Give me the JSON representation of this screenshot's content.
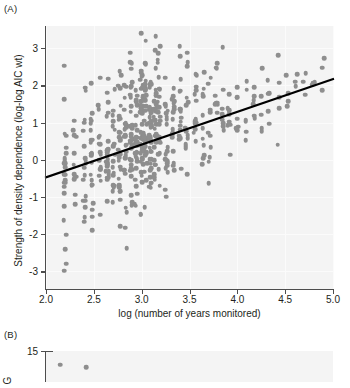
{
  "figure": {
    "panel_a_tag": "(A)",
    "panel_b_tag": "(B)",
    "point_color": "#8e8e8e",
    "line_color": "#000000",
    "plot_background": "#f4f4f4",
    "axis_color": "#4d4d4d"
  },
  "chart_data": {
    "type": "scatter",
    "title": "",
    "xlabel": "log (number of years monitored)",
    "ylabel": "Strength of density dependence (log-log AIC wt)",
    "xlim": [
      2.0,
      5.0
    ],
    "ylim": [
      -3.5,
      3.6
    ],
    "xticks": [
      2.0,
      2.5,
      3.0,
      3.5,
      4.0,
      4.5,
      5.0
    ],
    "xticklabels": [
      "2.0",
      "2.5",
      "3.0",
      "3.5",
      "4.0",
      "4.5",
      "5.0"
    ],
    "yticks": [
      -3,
      -2,
      -1,
      0,
      1,
      2,
      3
    ],
    "yticklabels": [
      "-3",
      "-2",
      "-1",
      "0",
      "1",
      "2",
      "3"
    ],
    "grid": true,
    "legend": "none",
    "fit_line": {
      "type": "linear",
      "x_start": 2.0,
      "y_start": -0.47,
      "x_end": 5.0,
      "y_end": 2.17,
      "slope": 0.88,
      "intercept": -2.23
    },
    "point_columns": [
      {
        "x": 2.2,
        "n": 26,
        "y_center": -0.35,
        "y_spread": 2.25
      },
      {
        "x": 2.3,
        "n": 12,
        "y_center": -0.15,
        "y_spread": 2.0
      },
      {
        "x": 2.4,
        "n": 18,
        "y_center": 0.05,
        "y_spread": 2.15
      },
      {
        "x": 2.48,
        "n": 22,
        "y_center": 0.2,
        "y_spread": 2.2
      },
      {
        "x": 2.56,
        "n": 16,
        "y_center": 0.1,
        "y_spread": 2.05
      },
      {
        "x": 2.64,
        "n": 24,
        "y_center": 0.35,
        "y_spread": 2.2
      },
      {
        "x": 2.71,
        "n": 20,
        "y_center": 0.3,
        "y_spread": 2.1
      },
      {
        "x": 2.77,
        "n": 30,
        "y_center": 0.45,
        "y_spread": 2.25
      },
      {
        "x": 2.83,
        "n": 26,
        "y_center": 0.55,
        "y_spread": 2.15
      },
      {
        "x": 2.89,
        "n": 34,
        "y_center": 0.6,
        "y_spread": 2.2
      },
      {
        "x": 2.94,
        "n": 30,
        "y_center": 0.7,
        "y_spread": 2.1
      },
      {
        "x": 3.0,
        "n": 44,
        "y_center": 0.8,
        "y_spread": 2.25
      },
      {
        "x": 3.04,
        "n": 32,
        "y_center": 0.85,
        "y_spread": 2.05
      },
      {
        "x": 3.09,
        "n": 40,
        "y_center": 0.9,
        "y_spread": 2.15
      },
      {
        "x": 3.14,
        "n": 28,
        "y_center": 0.8,
        "y_spread": 2.0
      },
      {
        "x": 3.18,
        "n": 24,
        "y_center": 0.95,
        "y_spread": 1.95
      },
      {
        "x": 3.26,
        "n": 20,
        "y_center": 0.85,
        "y_spread": 2.0
      },
      {
        "x": 3.33,
        "n": 18,
        "y_center": 1.0,
        "y_spread": 1.9
      },
      {
        "x": 3.4,
        "n": 16,
        "y_center": 1.05,
        "y_spread": 1.85
      },
      {
        "x": 3.47,
        "n": 14,
        "y_center": 1.0,
        "y_spread": 1.8
      },
      {
        "x": 3.56,
        "n": 13,
        "y_center": 1.1,
        "y_spread": 1.75
      },
      {
        "x": 3.64,
        "n": 11,
        "y_center": 1.15,
        "y_spread": 1.7
      },
      {
        "x": 3.71,
        "n": 10,
        "y_center": 1.2,
        "y_spread": 1.65
      },
      {
        "x": 3.78,
        "n": 9,
        "y_center": 1.15,
        "y_spread": 1.6
      },
      {
        "x": 3.85,
        "n": 8,
        "y_center": 1.25,
        "y_spread": 1.55
      },
      {
        "x": 3.91,
        "n": 8,
        "y_center": 1.3,
        "y_spread": 1.5
      },
      {
        "x": 4.0,
        "n": 7,
        "y_center": 1.35,
        "y_spread": 1.45
      },
      {
        "x": 4.09,
        "n": 6,
        "y_center": 1.4,
        "y_spread": 1.35
      },
      {
        "x": 4.17,
        "n": 6,
        "y_center": 1.45,
        "y_spread": 1.3
      },
      {
        "x": 4.25,
        "n": 5,
        "y_center": 1.5,
        "y_spread": 1.25
      },
      {
        "x": 4.32,
        "n": 5,
        "y_center": 1.55,
        "y_spread": 1.2
      },
      {
        "x": 4.43,
        "n": 5,
        "y_center": 1.7,
        "y_spread": 1.15
      },
      {
        "x": 4.52,
        "n": 4,
        "y_center": 1.75,
        "y_spread": 1.1
      },
      {
        "x": 4.61,
        "n": 3,
        "y_center": 1.95,
        "y_spread": 0.95
      },
      {
        "x": 4.7,
        "n": 3,
        "y_center": 2.1,
        "y_spread": 0.85
      },
      {
        "x": 4.8,
        "n": 3,
        "y_center": 2.25,
        "y_spread": 0.8
      },
      {
        "x": 4.9,
        "n": 3,
        "y_center": 2.45,
        "y_spread": 0.7
      }
    ]
  },
  "panel_b": {
    "ytick_label": "15",
    "ylabel_fragment": "G",
    "points": [
      {
        "x": 2.15,
        "y": 14.2
      },
      {
        "x": 2.42,
        "y": 14.0
      }
    ]
  }
}
